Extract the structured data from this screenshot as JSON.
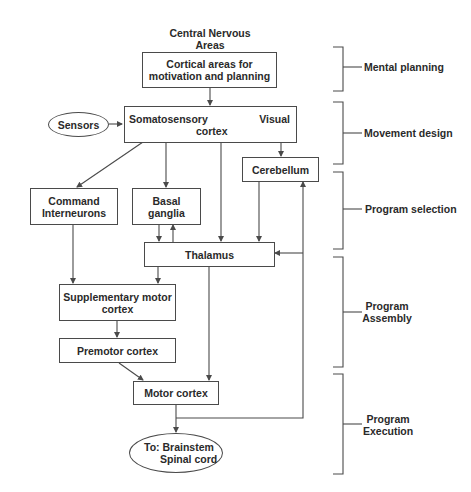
{
  "title": {
    "line1": "Central Nervous",
    "line2": "Areas"
  },
  "nodes": {
    "cortical": {
      "line1": "Cortical areas for",
      "line2": "motivation and planning"
    },
    "sensors": {
      "label": "Sensors"
    },
    "somatosensory": {
      "left": "Somatosensory",
      "right": "Visual",
      "bottom": "cortex"
    },
    "cerebellum": {
      "label": "Cerebellum"
    },
    "command": {
      "line1": "Command",
      "line2": "Interneurons"
    },
    "basal": {
      "line1": "Basal",
      "line2": "ganglia"
    },
    "thalamus": {
      "label": "Thalamus"
    },
    "supplementary": {
      "line1": "Supplementary motor",
      "line2": "cortex"
    },
    "premotor": {
      "label": "Premotor cortex"
    },
    "motor": {
      "label": "Motor cortex"
    },
    "output": {
      "line1": "To: Brainstem",
      "line2": "Spinal cord"
    }
  },
  "stages": [
    {
      "line1": "Mental planning",
      "line2": ""
    },
    {
      "line1": "Movement design",
      "line2": ""
    },
    {
      "line1": "Program selection",
      "line2": ""
    },
    {
      "line1": "Program",
      "line2": "Assembly"
    },
    {
      "line1": "Program",
      "line2": "Execution"
    }
  ],
  "colors": {
    "line": "#4a4a4a",
    "text": "#2a2a2a",
    "background": "#ffffff"
  }
}
